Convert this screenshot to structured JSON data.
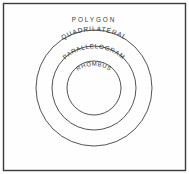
{
  "diagram": {
    "type": "euler-nested-circles",
    "background_color": "#fefefe",
    "border_color": "#3a3a3a",
    "stroke_color": "#3f3f3f",
    "text_color": "#2e2e2e",
    "outer_label": "POLYGON",
    "sets": [
      {
        "label": "QUADRILATERAL",
        "level": 1,
        "center_x": 94,
        "center_y": 88,
        "radius": 58
      },
      {
        "label": "PARALLELOGRAM",
        "level": 2,
        "center_x": 94,
        "center_y": 88,
        "radius": 42
      },
      {
        "label": "RHOMBUS",
        "level": 3,
        "center_x": 94,
        "center_y": 88,
        "radius": 27
      }
    ]
  }
}
